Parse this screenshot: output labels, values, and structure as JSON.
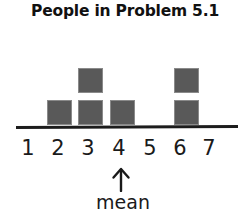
{
  "title": "People in Problem 5.1",
  "annotation": {
    "arrow_icon": "up-arrow-icon",
    "label": "mean",
    "points_to_category": "4"
  },
  "colors": {
    "square_fill": "#595959",
    "square_border": "#8a8a8a",
    "axis": "#1c1c1c",
    "text": "#1a1a1a",
    "background": "#ffffff"
  },
  "chart_data": {
    "type": "bar",
    "title": "People in Problem 5.1",
    "xlabel": "",
    "ylabel": "",
    "categories": [
      "1",
      "2",
      "3",
      "4",
      "5",
      "6",
      "7"
    ],
    "values": [
      0,
      1,
      2,
      1,
      0,
      2,
      0
    ],
    "ylim": [
      0,
      2
    ],
    "grid": false,
    "legend": null,
    "squares": [
      {
        "category": "2",
        "row": 1,
        "x": 47,
        "y": 100
      },
      {
        "category": "3",
        "row": 1,
        "x": 78,
        "y": 100
      },
      {
        "category": "3",
        "row": 2,
        "x": 78,
        "y": 68
      },
      {
        "category": "4",
        "row": 1,
        "x": 110,
        "y": 100
      },
      {
        "category": "6",
        "row": 1,
        "x": 174,
        "y": 100
      },
      {
        "category": "6",
        "row": 2,
        "x": 174,
        "y": 68
      }
    ],
    "tick_positions": [
      28,
      58,
      88,
      119,
      150,
      180,
      209
    ]
  }
}
